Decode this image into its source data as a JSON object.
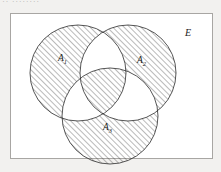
{
  "figure": {
    "type": "venn-diagram",
    "set_count": 3,
    "top_artifact_text": "·· ········"
  },
  "universe": {
    "label": "E",
    "label_x": 185,
    "label_y": 36,
    "rect": {
      "x": 10,
      "y": 13,
      "width": 202,
      "height": 145
    },
    "border_color": "#a8a6a3",
    "fill_color": "#ffffff"
  },
  "style": {
    "stroke_color": "#2b2b2b",
    "stroke_width": 0.8,
    "hatch_color": "#3a3a3a",
    "hatch_width": 0.7,
    "hatch_spacing": 4,
    "hatch_angle_deg": 45,
    "page_background": "#f2f1ef"
  },
  "sets": [
    {
      "id": "A1",
      "label": "A",
      "subscript": "1",
      "cx": 78,
      "cy": 73,
      "r": 48,
      "label_x": 58,
      "label_y": 61
    },
    {
      "id": "A2",
      "label": "A",
      "subscript": "2",
      "cx": 128,
      "cy": 73,
      "r": 48,
      "label_x": 137,
      "label_y": 63
    },
    {
      "id": "A3",
      "label": "A",
      "subscript": "3",
      "cx": 110,
      "cy": 116,
      "r": 48,
      "label_x": 103,
      "label_y": 130
    }
  ],
  "region_shading": [
    {
      "region": "A1-only",
      "shaded": true
    },
    {
      "region": "A2-only",
      "shaded": true
    },
    {
      "region": "A3-only",
      "shaded": true
    },
    {
      "region": "A1-and-A2-only",
      "shaded": false
    },
    {
      "region": "A1-and-A3-only",
      "shaded": false
    },
    {
      "region": "A2-and-A3-only",
      "shaded": false
    },
    {
      "region": "A1-and-A2-and-A3",
      "shaded": true
    },
    {
      "region": "outside-all-circles",
      "shaded": false
    }
  ]
}
